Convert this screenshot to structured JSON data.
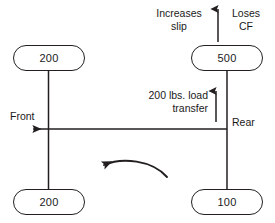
{
  "diagram": {
    "background_color": "#ffffff",
    "line_color": "#231f20",
    "text_color": "#1a1a1a",
    "corners": {
      "front_left": {
        "value": "200",
        "unit": "lbs"
      },
      "rear_left": {
        "value": "500",
        "unit": "lbs"
      },
      "front_right": {
        "value": "200",
        "unit": "lbs"
      },
      "rear_right": {
        "value": "100",
        "unit": "lbs"
      }
    },
    "labels": {
      "increases_slip": "Increases slip",
      "loses_cf": "Loses CF",
      "load_transfer": "200 lbs. load transfer",
      "front": "Front",
      "rear": "Rear"
    },
    "arrows": {
      "top_vertical": {
        "name": "upward-arrow",
        "direction": "up"
      },
      "load_transfer": {
        "name": "load-transfer-arrow",
        "direction": "up"
      },
      "front_direction": {
        "name": "front-direction-arrow",
        "direction": "left"
      },
      "yaw_rotation": {
        "name": "yaw-rotation-arrow",
        "direction": "counter-clockwise"
      }
    }
  }
}
